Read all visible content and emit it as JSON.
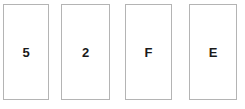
{
  "scene": {
    "background_color": "#ffffff",
    "card_fill_color": "#ffffff",
    "card_border_color": "#b4b4b4",
    "label_color": "#1a1a1a"
  },
  "cards": [
    {
      "label": "5",
      "name": "card-5"
    },
    {
      "label": "2",
      "name": "card-2"
    },
    {
      "label": "F",
      "name": "card-f"
    },
    {
      "label": "E",
      "name": "card-e"
    }
  ]
}
